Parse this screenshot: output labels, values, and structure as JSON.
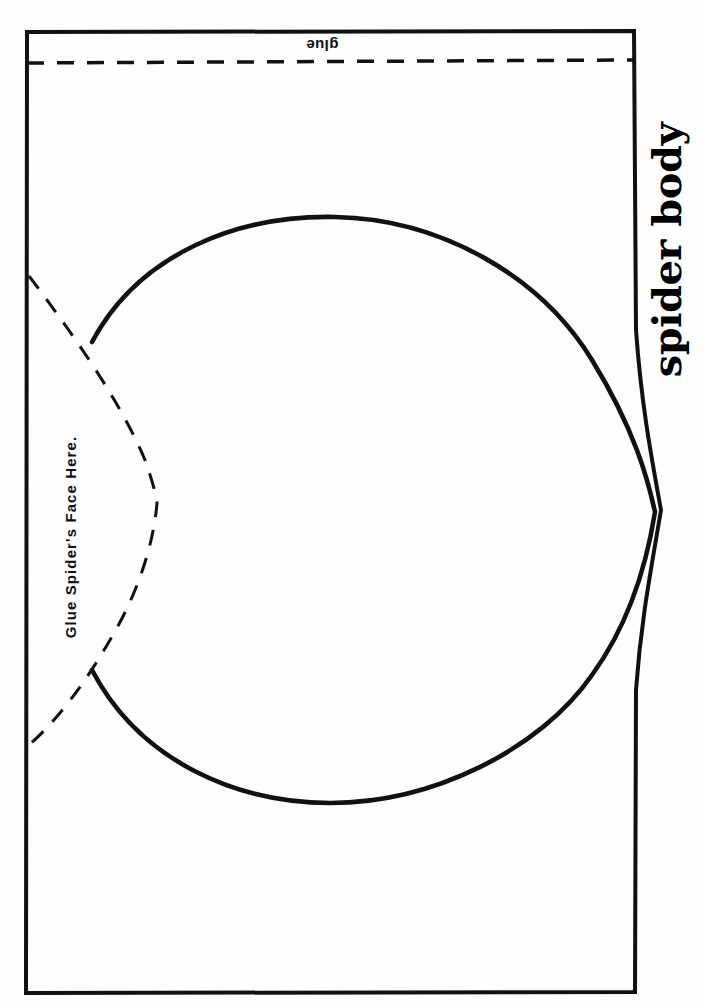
{
  "document": {
    "type": "printable-craft-template",
    "title": "spider body",
    "background_color": "#ffffff",
    "ink_color": "#000000",
    "orientation": "landscape-rotated"
  },
  "labels": {
    "glue_tab": "glue",
    "face_placement": "Glue Spider's Face Here.",
    "body_title": "spider body"
  },
  "guides": {
    "glue_fold_line": {
      "name": "glue-fold-dashed-line",
      "style": "dashed",
      "orientation": "horizontal"
    },
    "face_arc": {
      "name": "face-placement-dashed-arc",
      "style": "dashed",
      "orientation": "vertical-arc"
    },
    "body_outline": {
      "name": "spider-body-cut-outline",
      "style": "solid",
      "shape": "oval"
    },
    "page_border": {
      "name": "template-page-border",
      "style": "solid",
      "shape": "rectangle"
    }
  }
}
